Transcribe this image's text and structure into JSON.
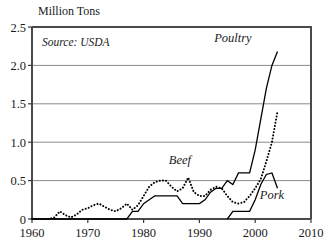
{
  "chart_data": {
    "type": "line",
    "title": "Million Tons",
    "ylabel": "Million Tons",
    "xlabel": "",
    "source_note": "Source: USDA",
    "xlim": [
      1960,
      2010
    ],
    "ylim": [
      0,
      2.5
    ],
    "grid": true,
    "legend_position": "inline-annotations",
    "y_ticks": [
      "0",
      "0.5",
      "1.0",
      "1.5",
      "2.0",
      "2.5"
    ],
    "y_tick_values": [
      0,
      0.5,
      1.0,
      1.5,
      2.0,
      2.5
    ],
    "x_ticks": [
      "1960",
      "1970",
      "1980",
      "1990",
      "2000",
      "2010"
    ],
    "x_tick_values": [
      1960,
      1970,
      1980,
      1990,
      2000,
      2010
    ],
    "series": [
      {
        "name": "Poultry",
        "style": "solid",
        "label": "Poultry",
        "label_x": 1996.0,
        "label_y": 2.3,
        "x": [
          1960,
          1961,
          1962,
          1963,
          1964,
          1965,
          1966,
          1967,
          1968,
          1969,
          1970,
          1971,
          1972,
          1973,
          1974,
          1975,
          1976,
          1977,
          1978,
          1979,
          1980,
          1981,
          1982,
          1983,
          1984,
          1985,
          1986,
          1987,
          1988,
          1989,
          1990,
          1991,
          1992,
          1993,
          1994,
          1995,
          1996,
          1997,
          1998,
          1999,
          2000,
          2001,
          2002,
          2003,
          2004
        ],
        "values": [
          0,
          0,
          0,
          0,
          0,
          0,
          0,
          0,
          0,
          0,
          0,
          0,
          0,
          0,
          0,
          0,
          0,
          0,
          0.1,
          0.1,
          0.2,
          0.25,
          0.3,
          0.3,
          0.3,
          0.3,
          0.3,
          0.2,
          0.2,
          0.2,
          0.2,
          0.25,
          0.35,
          0.4,
          0.4,
          0.5,
          0.45,
          0.6,
          0.6,
          0.6,
          0.9,
          1.3,
          1.7,
          2.0,
          2.18
        ]
      },
      {
        "name": "Beef",
        "style": "dotted",
        "label": "Beef",
        "label_x": 1986.5,
        "label_y": 0.72,
        "x": [
          1960,
          1961,
          1962,
          1963,
          1964,
          1965,
          1966,
          1967,
          1968,
          1969,
          1970,
          1971,
          1972,
          1973,
          1974,
          1975,
          1976,
          1977,
          1978,
          1979,
          1980,
          1981,
          1982,
          1983,
          1984,
          1985,
          1986,
          1987,
          1988,
          1989,
          1990,
          1991,
          1992,
          1993,
          1994,
          1995,
          1996,
          1997,
          1998,
          1999,
          2000,
          2001,
          2002,
          2003,
          2004
        ],
        "values": [
          0,
          0,
          0,
          0,
          0.02,
          0.1,
          0.05,
          0.02,
          0.06,
          0.12,
          0.14,
          0.18,
          0.2,
          0.16,
          0.12,
          0.1,
          0.14,
          0.2,
          0.12,
          0.18,
          0.3,
          0.42,
          0.48,
          0.5,
          0.5,
          0.42,
          0.36,
          0.4,
          0.54,
          0.35,
          0.3,
          0.3,
          0.38,
          0.42,
          0.4,
          0.3,
          0.22,
          0.2,
          0.22,
          0.3,
          0.4,
          0.52,
          0.75,
          1.0,
          1.4
        ]
      },
      {
        "name": "Pork",
        "style": "solid",
        "label": "Pork",
        "label_x": 2003.0,
        "label_y": 0.26,
        "x": [
          1995,
          1996,
          1997,
          1998,
          1999,
          2000,
          2001,
          2002,
          2003,
          2004
        ],
        "values": [
          0,
          0.1,
          0.1,
          0.1,
          0.1,
          0.25,
          0.45,
          0.58,
          0.6,
          0.4
        ]
      }
    ]
  },
  "plot": {
    "left": 32,
    "right": 311,
    "top": 27,
    "bottom": 219
  }
}
